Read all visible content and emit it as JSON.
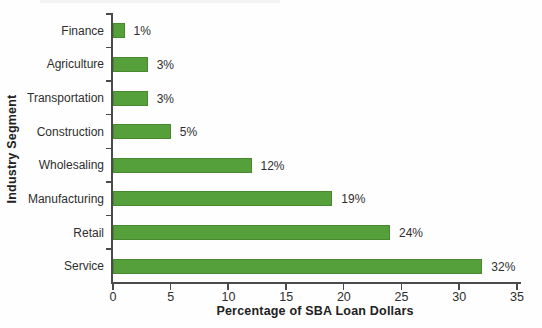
{
  "chart_data": {
    "type": "bar",
    "orientation": "horizontal",
    "title": "",
    "xlabel": "Percentage of SBA Loan Dollars",
    "ylabel": "Industry Segment",
    "categories": [
      "Finance",
      "Agriculture",
      "Transportation",
      "Construction",
      "Wholesaling",
      "Manufacturing",
      "Retail",
      "Service"
    ],
    "values": [
      1,
      3,
      3,
      5,
      12,
      19,
      24,
      32
    ],
    "value_labels": [
      "1%",
      "3%",
      "3%",
      "5%",
      "12%",
      "19%",
      "24%",
      "32%"
    ],
    "xlim": [
      0,
      35
    ],
    "xticks": [
      0,
      5,
      10,
      15,
      20,
      25,
      30,
      35
    ],
    "grid": false,
    "legend": false,
    "bar_color": "#56a03c",
    "axis_color": "#4a4a4a",
    "text_color": "#2e2e2e"
  }
}
